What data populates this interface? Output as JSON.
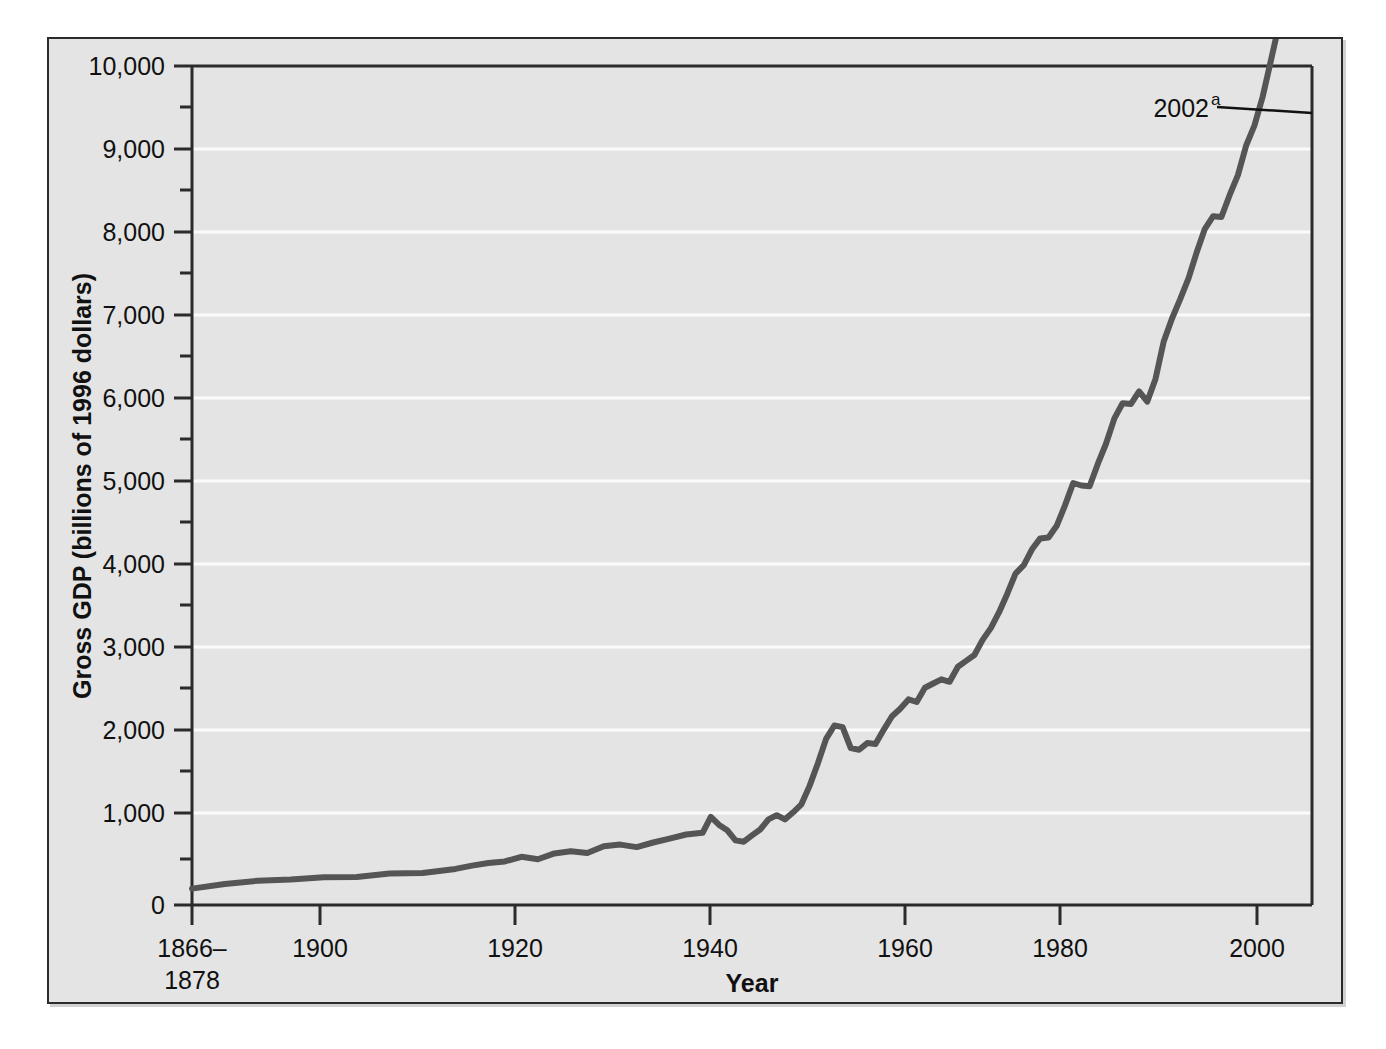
{
  "figure": {
    "background_color": "#e4e4e4",
    "frame_color": "#2b2b2b",
    "page_background": "#ffffff"
  },
  "chart_data": {
    "type": "line",
    "title": "",
    "xlabel": "Year",
    "ylabel": "Gross GDP (billions of 1996 dollars)",
    "xlim": [
      1866,
      2002
    ],
    "ylim": [
      0,
      10000
    ],
    "grid": true,
    "grid_color": "#ffffff",
    "legend": "none",
    "line_color": "#555555",
    "line_width": 6,
    "x_tick_labels": [
      "1866–\n1878",
      "1900",
      "1920",
      "1940",
      "1960",
      "1980",
      "2000"
    ],
    "x_tick_label_line1": "1866–",
    "x_tick_label_line2": "1878",
    "x_ticks": [
      1866,
      1900,
      1920,
      1940,
      1960,
      1980,
      2000
    ],
    "y_ticks": [
      0,
      1000,
      2000,
      3000,
      4000,
      5000,
      6000,
      7000,
      8000,
      9000,
      10000
    ],
    "y_tick_labels": [
      "0",
      "1,000",
      "2,000",
      "3,000",
      "4,000",
      "5,000",
      "6,000",
      "7,000",
      "8,000",
      "9,000",
      "10,000"
    ],
    "y_minor_ticks": [
      500,
      1500,
      2500,
      3500,
      4500,
      5500,
      6500,
      7500,
      8500,
      9500
    ],
    "annotations": [
      {
        "label": "2002",
        "superscript": "a",
        "points_to_x": 2002,
        "points_to_y": 9440
      }
    ],
    "series": [
      {
        "name": "Gross GDP",
        "x": [
          1866,
          1870,
          1874,
          1878,
          1882,
          1886,
          1890,
          1894,
          1898,
          1900,
          1902,
          1904,
          1906,
          1908,
          1910,
          1912,
          1914,
          1916,
          1918,
          1920,
          1922,
          1924,
          1926,
          1928,
          1929,
          1930,
          1931,
          1932,
          1933,
          1934,
          1935,
          1936,
          1937,
          1938,
          1939,
          1940,
          1941,
          1942,
          1943,
          1944,
          1945,
          1946,
          1947,
          1948,
          1949,
          1950,
          1951,
          1952,
          1953,
          1954,
          1955,
          1956,
          1957,
          1958,
          1959,
          1960,
          1961,
          1962,
          1963,
          1964,
          1965,
          1966,
          1967,
          1968,
          1969,
          1970,
          1971,
          1972,
          1973,
          1974,
          1975,
          1976,
          1977,
          1978,
          1979,
          1980,
          1981,
          1982,
          1983,
          1984,
          1985,
          1986,
          1987,
          1988,
          1989,
          1990,
          1991,
          1992,
          1993,
          1994,
          1995,
          1996,
          1997,
          1998,
          1999,
          2000,
          2001,
          2002
        ],
        "values": [
          195,
          250,
          290,
          305,
          330,
          335,
          375,
          380,
          430,
          470,
          500,
          520,
          575,
          545,
          615,
          640,
          620,
          700,
          720,
          690,
          745,
          790,
          840,
          860,
          1050,
          955,
          890,
          770,
          755,
          830,
          900,
          1020,
          1070,
          1020,
          1105,
          1200,
          1420,
          1690,
          1980,
          2140,
          2120,
          1870,
          1850,
          1930,
          1920,
          2090,
          2250,
          2340,
          2450,
          2420,
          2590,
          2640,
          2690,
          2660,
          2840,
          2910,
          2980,
          3160,
          3300,
          3490,
          3710,
          3950,
          4050,
          4240,
          4370,
          4380,
          4520,
          4760,
          5030,
          5000,
          4990,
          5260,
          5500,
          5800,
          5980,
          5970,
          6120,
          6000,
          6270,
          6720,
          6990,
          7220,
          7470,
          7780,
          8060,
          8210,
          8200,
          8460,
          8700,
          9050,
          9290,
          9630,
          10060,
          10500,
          10970,
          11470,
          11590,
          11800
        ],
        "values_note": "plotted as real gross GDP in billions of 1996 dollars"
      }
    ]
  }
}
